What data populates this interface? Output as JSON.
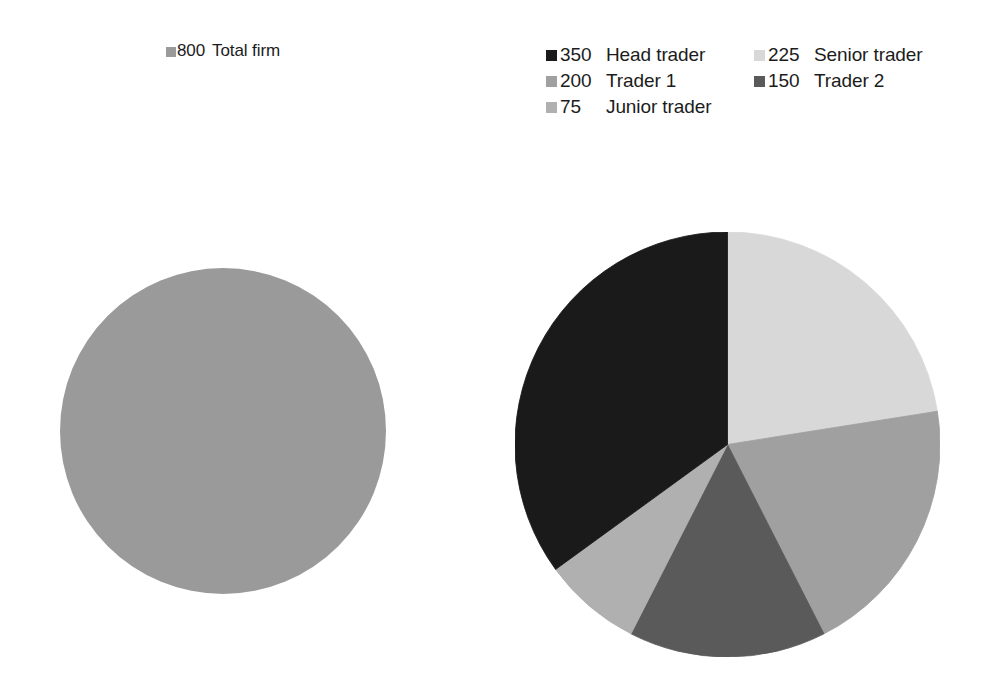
{
  "background_color": "#ffffff",
  "left_chart": {
    "legend": {
      "entries": [
        {
          "value": "800",
          "label": "Total firm",
          "color": "#9a9a9a",
          "swatch_name": "legend-swatch-total-firm"
        }
      ]
    }
  },
  "right_chart": {
    "legend": {
      "entries": [
        {
          "value": "350",
          "label": "Head trader",
          "color": "#1a1a1a",
          "swatch_name": "legend-swatch-head-trader"
        },
        {
          "value": "225",
          "label": "Senior trader",
          "color": "#d8d8d8",
          "swatch_name": "legend-swatch-senior-trader"
        },
        {
          "value": "200",
          "label": "Trader 1",
          "color": "#a0a0a0",
          "swatch_name": "legend-swatch-trader-1"
        },
        {
          "value": "150",
          "label": "Trader 2",
          "color": "#5a5a5a",
          "swatch_name": "legend-swatch-trader-2"
        },
        {
          "value": "75",
          "label": "Junior trader",
          "color": "#b0b0b0",
          "swatch_name": "legend-swatch-junior-trader"
        }
      ]
    }
  },
  "chart_data": [
    {
      "type": "pie",
      "name": "total-firm-pie",
      "title": "",
      "categories": [
        "Total firm"
      ],
      "values": [
        800
      ],
      "total": 800,
      "colors": [
        "#9a9a9a"
      ],
      "legend_position": "top",
      "start_angle_deg": 0,
      "direction": "clockwise",
      "center_px": [
        223,
        431
      ],
      "radius_px": 163,
      "slices": [
        {
          "label": "Total firm",
          "value": 800,
          "percent": 100.0,
          "color": "#9a9a9a",
          "sweep_deg": 360
        }
      ]
    },
    {
      "type": "pie",
      "name": "trader-breakdown-pie",
      "title": "",
      "categories": [
        "Head trader",
        "Senior trader",
        "Trader 1",
        "Trader 2",
        "Junior trader"
      ],
      "values": [
        350,
        225,
        200,
        150,
        75
      ],
      "total": 1000,
      "colors": [
        "#1a1a1a",
        "#d8d8d8",
        "#a0a0a0",
        "#5a5a5a",
        "#b0b0b0"
      ],
      "legend_position": "top",
      "start_angle_deg": 0,
      "direction": "clockwise",
      "center_px": [
        727,
        444
      ],
      "radius_px": 212,
      "slices": [
        {
          "label": "Senior trader",
          "value": 225,
          "percent": 22.5,
          "color": "#d8d8d8",
          "start_deg": 0,
          "sweep_deg": 81
        },
        {
          "label": "Trader 1",
          "value": 200,
          "percent": 20.0,
          "color": "#a0a0a0",
          "start_deg": 81,
          "sweep_deg": 72
        },
        {
          "label": "Trader 2",
          "value": 150,
          "percent": 15.0,
          "color": "#5a5a5a",
          "start_deg": 153,
          "sweep_deg": 54
        },
        {
          "label": "Junior trader",
          "value": 75,
          "percent": 7.5,
          "color": "#b0b0b0",
          "start_deg": 207,
          "sweep_deg": 27
        },
        {
          "label": "Head trader",
          "value": 350,
          "percent": 35.0,
          "color": "#1a1a1a",
          "start_deg": 234,
          "sweep_deg": 126
        }
      ]
    }
  ]
}
